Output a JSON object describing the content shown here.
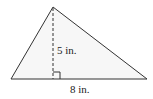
{
  "diagram": {
    "type": "triangle",
    "labels": {
      "height": "5 in.",
      "base": "8 in."
    },
    "vertices": {
      "apex": [
        53,
        7
      ],
      "bottom_left": [
        11,
        79
      ],
      "bottom_right": [
        147,
        79
      ]
    },
    "colors": {
      "stroke": "#333333",
      "fill": "#f7f7f7",
      "text": "#222222"
    }
  }
}
